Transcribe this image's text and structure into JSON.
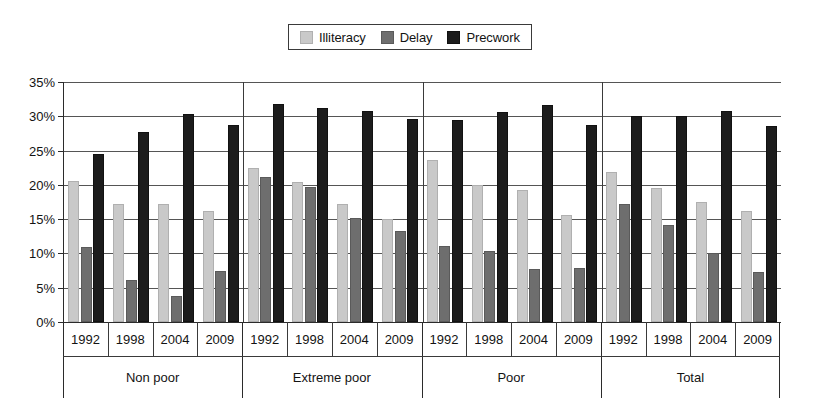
{
  "chart_data": {
    "type": "bar",
    "title": "",
    "xlabel": "",
    "ylabel": "",
    "ylim": [
      0,
      35
    ],
    "ytick_labels": [
      "0%",
      "5%",
      "10%",
      "15%",
      "20%",
      "25%",
      "30%",
      "35%"
    ],
    "ytick_values": [
      0,
      5,
      10,
      15,
      20,
      25,
      30,
      35
    ],
    "grid": true,
    "legend_position": "top-center",
    "categories": [
      "1992",
      "1998",
      "2004",
      "2009"
    ],
    "groups": [
      "Non poor",
      "Extreme poor",
      "Poor",
      "Total"
    ],
    "series": [
      {
        "name": "Illiteracy",
        "color": "#c9c9c9",
        "values": [
          [
            20.6,
            17.2,
            17.2,
            16.2
          ],
          [
            22.5,
            20.4,
            17.2,
            15.0
          ],
          [
            23.7,
            20.0,
            19.3,
            15.6
          ],
          [
            21.9,
            19.5,
            17.5,
            16.2
          ]
        ]
      },
      {
        "name": "Delay",
        "color": "#6e6e6e",
        "values": [
          [
            11.0,
            6.2,
            3.8,
            7.4
          ],
          [
            21.2,
            19.7,
            15.2,
            13.3
          ],
          [
            11.1,
            10.4,
            7.8,
            7.9
          ],
          [
            17.2,
            14.1,
            10.0,
            7.3
          ]
        ]
      },
      {
        "name": "Precwork",
        "color": "#1c1c1c",
        "values": [
          [
            24.5,
            27.7,
            30.3,
            28.7
          ],
          [
            31.8,
            31.2,
            30.8,
            29.6
          ],
          [
            29.4,
            30.6,
            31.6,
            28.8
          ],
          [
            30.0,
            30.0,
            30.8,
            28.6
          ]
        ]
      }
    ]
  },
  "legend": {
    "items": [
      {
        "label": "Illiteracy",
        "color": "#c9c9c9"
      },
      {
        "label": "Delay",
        "color": "#6e6e6e"
      },
      {
        "label": "Precwork",
        "color": "#1c1c1c"
      }
    ]
  },
  "axis": {
    "y_labels": [
      "35%",
      "30%",
      "25%",
      "20%",
      "15%",
      "10%",
      "5%",
      "0%"
    ]
  }
}
